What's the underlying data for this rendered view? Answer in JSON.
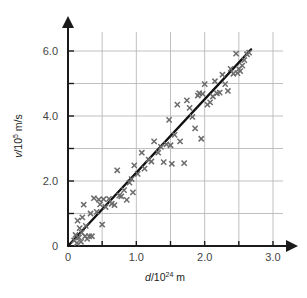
{
  "figure": {
    "background": "#ffffff",
    "grid_color": "#b9b9b9",
    "axis_color": "#1a1a1a",
    "marker_color": "#6b6b6b",
    "fit_line_color": "#111111"
  },
  "axes": {
    "x": {
      "title_var": "d",
      "title_slash": "/10",
      "title_exponent": "24",
      "title_unit": " m",
      "title_full": "d/10^24 m",
      "ticks": [
        "0",
        "1.0",
        "2.0",
        "3.0"
      ],
      "tick_values": [
        0,
        1.0,
        2.0,
        3.0
      ],
      "minor_tick_values": [
        0.5,
        1.5,
        2.5
      ],
      "range": [
        0,
        3.0
      ]
    },
    "y": {
      "title_var": "v",
      "title_slash": "/10",
      "title_exponent": "5",
      "title_unit": " m/s",
      "title_full": "v/10^5 m/s",
      "ticks": [
        "0",
        "2.0",
        "4.0",
        "6.0"
      ],
      "tick_values": [
        0,
        2.0,
        4.0,
        6.0
      ],
      "minor_tick_values": [
        1.0,
        3.0,
        5.0
      ],
      "range": [
        0,
        6.4
      ]
    }
  },
  "chart_data": {
    "type": "scatter",
    "title": "",
    "xlabel": "d/10^24 m",
    "ylabel": "v/10^5 m/s",
    "xlim": [
      0,
      3.0
    ],
    "ylim": [
      0,
      6.4
    ],
    "grid": true,
    "legend": "none",
    "marker": "x",
    "marker_color": "#6b6b6b",
    "series": [
      {
        "name": "galaxy recession measurements",
        "marker": "x",
        "points": [
          [
            0.09,
            0.17
          ],
          [
            0.11,
            0.34
          ],
          [
            0.13,
            0.09
          ],
          [
            0.14,
            0.78
          ],
          [
            0.16,
            0.26
          ],
          [
            0.17,
            0.55
          ],
          [
            0.19,
            0.13
          ],
          [
            0.2,
            0.41
          ],
          [
            0.21,
            0.88
          ],
          [
            0.23,
            1.27
          ],
          [
            0.25,
            0.3
          ],
          [
            0.26,
            0.62
          ],
          [
            0.28,
            0.22
          ],
          [
            0.31,
            0.3
          ],
          [
            0.33,
            1.0
          ],
          [
            0.35,
            0.3
          ],
          [
            0.38,
            1.47
          ],
          [
            0.42,
            1.05
          ],
          [
            0.45,
            1.43
          ],
          [
            0.47,
            1.28
          ],
          [
            0.5,
            0.66
          ],
          [
            0.52,
            1.44
          ],
          [
            0.55,
            1.2
          ],
          [
            0.6,
            1.45
          ],
          [
            0.64,
            1.3
          ],
          [
            0.68,
            1.26
          ],
          [
            0.72,
            2.33
          ],
          [
            0.75,
            1.55
          ],
          [
            0.78,
            1.53
          ],
          [
            0.82,
            1.72
          ],
          [
            0.86,
            1.42
          ],
          [
            0.9,
            1.95
          ],
          [
            0.93,
            2.06
          ],
          [
            0.95,
            1.65
          ],
          [
            0.97,
            2.48
          ],
          [
            1.02,
            2.22
          ],
          [
            1.08,
            2.87
          ],
          [
            1.12,
            2.38
          ],
          [
            1.18,
            2.66
          ],
          [
            1.22,
            2.6
          ],
          [
            1.26,
            3.22
          ],
          [
            1.32,
            2.87
          ],
          [
            1.36,
            3.05
          ],
          [
            1.4,
            2.58
          ],
          [
            1.44,
            3.13
          ],
          [
            1.48,
            3.88
          ],
          [
            1.5,
            3.1
          ],
          [
            1.52,
            2.53
          ],
          [
            1.56,
            3.42
          ],
          [
            1.6,
            4.35
          ],
          [
            1.64,
            3.22
          ],
          [
            1.7,
            2.55
          ],
          [
            1.74,
            4.48
          ],
          [
            1.78,
            4.25
          ],
          [
            1.82,
            3.97
          ],
          [
            1.86,
            3.62
          ],
          [
            1.9,
            4.63
          ],
          [
            1.92,
            4.7
          ],
          [
            1.95,
            3.3
          ],
          [
            1.97,
            4.68
          ],
          [
            2.0,
            4.98
          ],
          [
            2.04,
            4.35
          ],
          [
            2.08,
            4.42
          ],
          [
            2.12,
            4.6
          ],
          [
            2.15,
            5.07
          ],
          [
            2.18,
            4.7
          ],
          [
            2.22,
            4.72
          ],
          [
            2.26,
            5.27
          ],
          [
            2.3,
            4.98
          ],
          [
            2.34,
            4.77
          ],
          [
            2.38,
            5.45
          ],
          [
            2.42,
            5.3
          ],
          [
            2.46,
            5.92
          ],
          [
            2.48,
            5.32
          ],
          [
            2.5,
            5.45
          ],
          [
            2.52,
            5.38
          ],
          [
            2.55,
            5.55
          ],
          [
            2.58,
            5.72
          ],
          [
            2.62,
            5.9
          ],
          [
            2.65,
            5.95
          ]
        ]
      }
    ],
    "fit_line": {
      "name": "best fit line",
      "through_origin": true,
      "x_start": 0.0,
      "y_start": 0.0,
      "x_end": 2.68,
      "y_end": 6.05,
      "slope": 2.257,
      "color": "#111111"
    }
  }
}
